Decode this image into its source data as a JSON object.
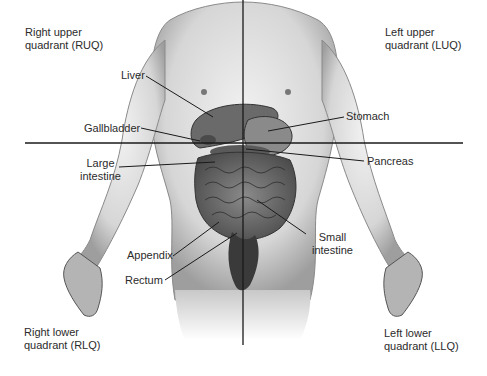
{
  "quadrants": {
    "ruq": {
      "line1": "Right upper",
      "line2": "quadrant (RUQ)"
    },
    "luq": {
      "line1": "Left upper",
      "line2": "quadrant (LUQ)"
    },
    "rlq": {
      "line1": "Right lower",
      "line2": "quadrant (RLQ)"
    },
    "llq": {
      "line1": "Left lower",
      "line2": "quadrant (LLQ)"
    }
  },
  "organs": {
    "liver": "Liver",
    "gallbladder": "Gallbladder",
    "large_intestine": {
      "line1": "Large",
      "line2": "intestine"
    },
    "stomach": "Stomach",
    "pancreas": "Pancreas",
    "small_intestine": {
      "line1": "Small",
      "line2": "intestine"
    },
    "appendix": "Appendix",
    "rectum": "Rectum"
  },
  "colors": {
    "line": "#1a1a1a",
    "skin_light": "#e6e6e6",
    "skin_mid": "#bdbdbd",
    "organ": "#6e6e6e",
    "organ_dark": "#3c3c3c"
  }
}
